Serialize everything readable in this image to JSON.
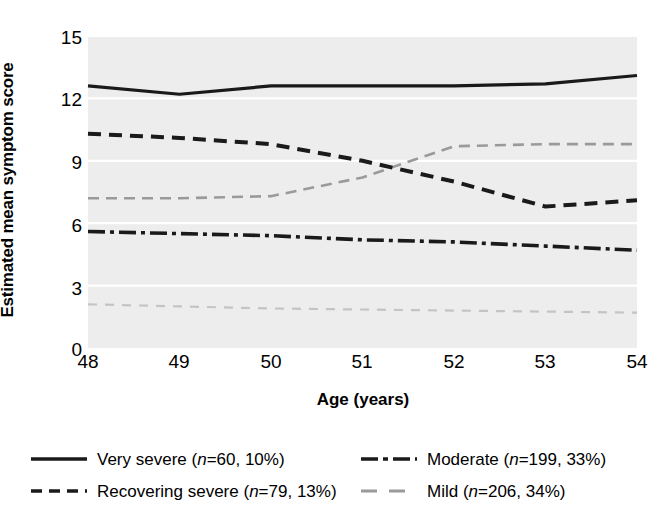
{
  "chart_data": {
    "type": "line",
    "title": "",
    "xlabel": "Age (years)",
    "ylabel": "Estimated mean symptom score",
    "xlim": [
      48,
      54
    ],
    "ylim": [
      0,
      15
    ],
    "xticks": [
      "48",
      "49",
      "50",
      "51",
      "52",
      "53",
      "54"
    ],
    "yticks": [
      "0",
      "3",
      "6",
      "9",
      "12",
      "15"
    ],
    "grid": true,
    "legend_position": "below",
    "x": [
      48,
      49,
      50,
      51,
      52,
      53,
      54
    ],
    "series": [
      {
        "name": "Very severe",
        "label": "Very severe (n=60, 10%)",
        "n": 60,
        "percent": "10%",
        "style": "solid",
        "color": "#1a1a1a",
        "values": [
          12.6,
          12.2,
          12.6,
          12.6,
          12.6,
          12.7,
          13.1
        ]
      },
      {
        "name": "Recovering severe",
        "label": "Recovering severe (n=79, 13%)",
        "n": 79,
        "percent": "13%",
        "style": "dashed",
        "color": "#1a1a1a",
        "values": [
          10.3,
          10.1,
          9.8,
          9.0,
          8.0,
          6.8,
          7.1
        ]
      },
      {
        "name": "Moderate",
        "label": "Moderate (n=199, 33%)",
        "n": 199,
        "percent": "33%",
        "style": "dashdot",
        "color": "#1a1a1a",
        "values": [
          5.6,
          5.5,
          5.4,
          5.2,
          5.1,
          4.9,
          4.7
        ]
      },
      {
        "name": "Mild",
        "label": "Mild (n=206, 34%)",
        "n": 206,
        "percent": "34%",
        "style": "dashed-light",
        "color": "#9a9a9a",
        "values": [
          7.2,
          7.2,
          7.3,
          8.2,
          9.7,
          9.8,
          9.8
        ]
      },
      {
        "name": "Mild low band",
        "label": "",
        "style": "dashed-faint",
        "color": "#c4c4c4",
        "values": [
          2.1,
          2.0,
          1.9,
          1.85,
          1.8,
          1.75,
          1.7
        ]
      }
    ]
  },
  "axes": {
    "ylabel": "Estimated mean symptom score",
    "xlabel": "Age (years)",
    "yticks": [
      "15",
      "12",
      "9",
      "6",
      "3",
      "0"
    ],
    "xticks": [
      "48",
      "49",
      "50",
      "51",
      "52",
      "53",
      "54"
    ]
  },
  "legend": {
    "items": [
      {
        "label_prefix": "Very severe (",
        "n_italic": "n",
        "label_suffix": "=60, 10%)",
        "style": "solid"
      },
      {
        "label_prefix": "Moderate (",
        "n_italic": "n",
        "label_suffix": "=199, 33%)",
        "style": "dashdot"
      },
      {
        "label_prefix": "Recovering severe (",
        "n_italic": "n",
        "label_suffix": "=79, 13%)",
        "style": "dashed"
      },
      {
        "label_prefix": "Mild (",
        "n_italic": "n",
        "label_suffix": "=206, 34%)",
        "style": "dashed-light"
      }
    ]
  },
  "style": {
    "plot_background": "#ededed",
    "gridline_color": "#ffffff",
    "dark_line": "#1a1a1a",
    "gray_line": "#9a9a9a",
    "faint_line": "#c4c4c4"
  }
}
